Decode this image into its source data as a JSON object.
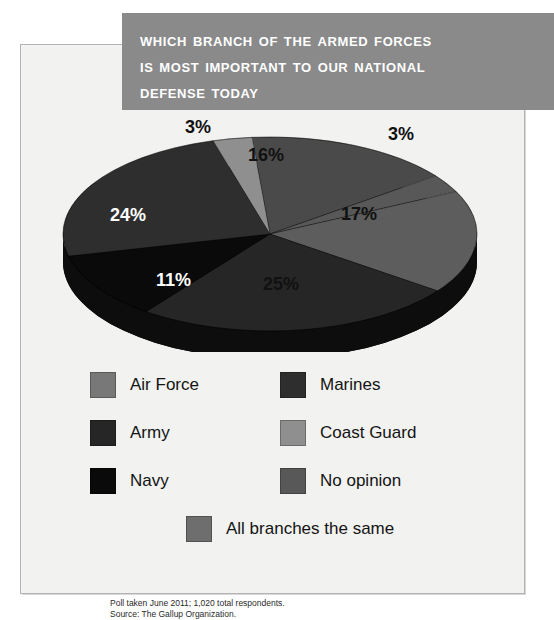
{
  "title": {
    "line1": "Which Branch of the Armed Forces",
    "line2": "Is Most Important to Our National",
    "line3": "Defense Today",
    "background_color": "#8a8a8a",
    "text_color": "#ffffff"
  },
  "footnote": {
    "line1": "Poll taken June 2011; 1,020 total respondents.",
    "line2": "Source: The Gallup Organization."
  },
  "legend": {
    "items": [
      {
        "label": "Air Force",
        "color": "#787878"
      },
      {
        "label": "Marines",
        "color": "#2e2e2e"
      },
      {
        "label": "Army",
        "color": "#262626"
      },
      {
        "label": "Coast Guard",
        "color": "#8f8f8f"
      },
      {
        "label": "Navy",
        "color": "#0a0a0a"
      },
      {
        "label": "No opinion",
        "color": "#585858"
      }
    ],
    "wide_item": {
      "label": "All branches the same",
      "color": "#6e6e6e"
    }
  },
  "chart_data": {
    "type": "pie",
    "title": "Which Branch of the Armed Forces Is Most Important to Our National Defense Today",
    "categories": [
      "All branches the same",
      "No opinion",
      "Air Force",
      "Army",
      "Navy",
      "Marines",
      "Coast Guard"
    ],
    "values": [
      16,
      3,
      17,
      25,
      11,
      24,
      3
    ],
    "labels": [
      "16%",
      "3%",
      "17%",
      "25%",
      "11%",
      "24%",
      "3%"
    ],
    "colors": [
      "#4a4a4a",
      "#585858",
      "#5d5d5d",
      "#262626",
      "#0a0a0a",
      "#2e2e2e",
      "#8f8f8f"
    ],
    "units": "percent",
    "total": 100,
    "legend_position": "below",
    "three_d": true,
    "slice_labels": {
      "all_branches_the_same": "16%",
      "no_opinion": "3%",
      "air_force": "17%",
      "army": "25%",
      "navy": "11%",
      "marines": "24%",
      "coast_guard": "3%"
    },
    "source": "The Gallup Organization",
    "sample": "1,020 total respondents",
    "date": "June 2011"
  }
}
